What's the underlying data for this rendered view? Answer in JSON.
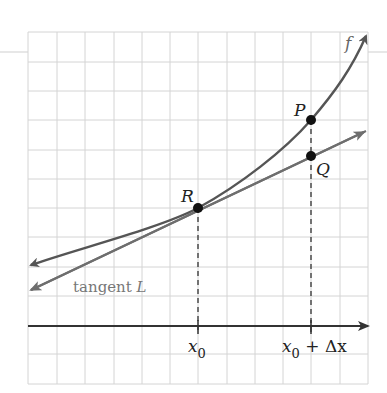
{
  "diagram": {
    "curve_label": "f",
    "tangent_label_prefix": "tangent ",
    "tangent_label_var": "L",
    "points": [
      {
        "name": "R",
        "label": "R",
        "x": 198,
        "y": 208
      },
      {
        "name": "P",
        "label": "P",
        "x": 311,
        "y": 120
      },
      {
        "name": "Q",
        "label": "Q",
        "x": 311,
        "y": 156
      }
    ],
    "x_ticks": [
      {
        "base": "x",
        "sub": "0",
        "suffix": ""
      },
      {
        "base": "x",
        "sub": "0",
        "suffix": " + Δx"
      }
    ],
    "colors": {
      "grid": "#d4d4d4",
      "curve": "#555555",
      "tangent": "#6e6e6e",
      "axis": "#333333",
      "point": "#111111",
      "label": "#222222",
      "tangent_label": "#777777"
    }
  }
}
